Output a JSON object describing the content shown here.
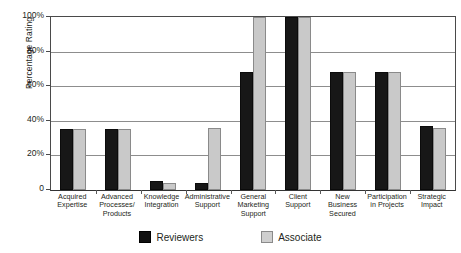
{
  "chart_data": {
    "type": "bar",
    "title": "",
    "xlabel": "",
    "ylabel": "Percentage Rating",
    "ylim": [
      0,
      100
    ],
    "ytick_labels": [
      "0",
      "20%",
      "40%",
      "60%",
      "80%",
      "100%"
    ],
    "ytick_values": [
      0,
      20,
      40,
      60,
      80,
      100
    ],
    "grid": true,
    "legend_position": "bottom",
    "categories": [
      "Acquired Expertise",
      "Advanced Processes/ Products",
      "Knowledge Integration",
      "Administrative Support",
      "General Marketing Support",
      "Client Support",
      "New Business Secured",
      "Participation in Projects",
      "Strategic Impact"
    ],
    "category_lines": [
      [
        "Acquired",
        "Expertise"
      ],
      [
        "Advanced",
        "Processes/",
        "Products"
      ],
      [
        "Knowledge",
        "Integration"
      ],
      [
        "Administrative",
        "Support"
      ],
      [
        "General",
        "Marketing",
        "Support"
      ],
      [
        "Client",
        "Support"
      ],
      [
        "New",
        "Business",
        "Secured"
      ],
      [
        "Participation",
        "in Projects"
      ],
      [
        "Strategic",
        "Impact"
      ]
    ],
    "series": [
      {
        "name": "Reviewers",
        "color": "#171717",
        "values": [
          35,
          35,
          5,
          4,
          68,
          100,
          68,
          68,
          37
        ]
      },
      {
        "name": "Associate",
        "color": "#c9c9c9",
        "values": [
          35,
          35,
          4,
          36,
          100,
          100,
          68,
          68,
          36
        ]
      }
    ]
  },
  "legend": {
    "items": [
      {
        "label": "Reviewers",
        "swatch": "reviewers"
      },
      {
        "label": "Associate",
        "swatch": "associate"
      }
    ]
  },
  "axis": {
    "y_title": "Percentage Rating"
  }
}
